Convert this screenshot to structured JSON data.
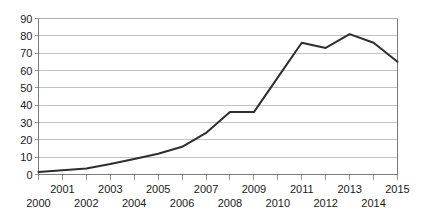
{
  "chart_data": {
    "type": "line",
    "title": "",
    "subtitle": "",
    "xlabel": "",
    "ylabel": "",
    "grid": true,
    "legend": false,
    "legend_position": "none",
    "line_color": "#2e2e2e",
    "grid_color": "#a8a8a8",
    "axis_color": "#7a7a7a",
    "background_color": "#ffffff",
    "xlim": [
      2000,
      2015
    ],
    "ylim": [
      0,
      90
    ],
    "ytick_labels": [
      "0",
      "10",
      "20",
      "30",
      "40",
      "50",
      "60",
      "70",
      "80",
      "90"
    ],
    "ytick_values": [
      0,
      10,
      20,
      30,
      40,
      50,
      60,
      70,
      80,
      90
    ],
    "xtick_labels": [
      "2000",
      "2001",
      "2002",
      "2003",
      "2004",
      "2005",
      "2006",
      "2007",
      "2008",
      "2009",
      "2010",
      "2011",
      "2012",
      "2013",
      "2014",
      "2015"
    ],
    "categories": [
      2000,
      2001,
      2002,
      2003,
      2004,
      2005,
      2006,
      2007,
      2008,
      2009,
      2010,
      2011,
      2012,
      2013,
      2014,
      2015
    ],
    "values": [
      1.5,
      2.5,
      3.5,
      6,
      9,
      12,
      16,
      24,
      36,
      36,
      56,
      76,
      73,
      81,
      76,
      65
    ],
    "series": [
      {
        "name": "series-1",
        "values": [
          1.5,
          2.5,
          3.5,
          6,
          9,
          12,
          16,
          24,
          36,
          36,
          56,
          76,
          73,
          81,
          76,
          65
        ]
      }
    ]
  },
  "axis": {
    "y_axis_name": "y-axis",
    "x_axis_name": "x-axis"
  }
}
